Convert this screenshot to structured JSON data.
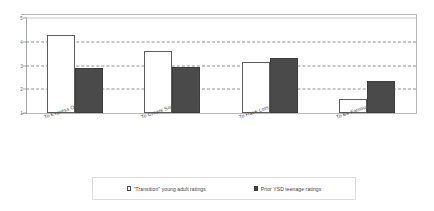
{
  "chart_data": {
    "type": "bar",
    "title": "",
    "subtitle": "",
    "xlabel": "",
    "ylabel": "",
    "ylim": [
      1,
      5
    ],
    "yticks": [
      "1",
      "2",
      "3",
      "4",
      "5"
    ],
    "grid": true,
    "legend_position": "bottom",
    "categories": [
      "To Express Oneself",
      "To Create Something New",
      "To Have Lots of Money",
      "To Be Famous"
    ],
    "series": [
      {
        "name": "\"Transition\" young adult ratings",
        "color": "#ffffff",
        "edge_color": "#5c5c5c",
        "values": [
          4.3,
          3.6,
          3.15,
          1.6
        ]
      },
      {
        "name": "Prior YSD teenage ratings",
        "color": "#4a4a4a",
        "edge_color": "#3d3d3d",
        "values": [
          2.9,
          2.95,
          3.3,
          2.35
        ]
      }
    ]
  },
  "legend": {
    "entries": [
      {
        "label": "\"Transition\" young adult ratings",
        "marker": "open-square-marker"
      },
      {
        "label": "Prior YSD teenage ratings",
        "marker": "filled-square-marker"
      }
    ]
  }
}
